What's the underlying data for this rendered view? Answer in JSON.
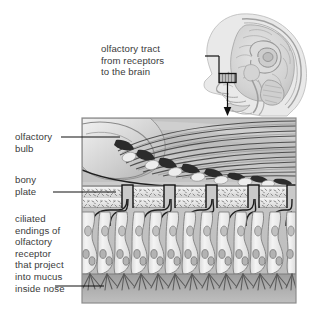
{
  "figure": {
    "background_color": "#ffffff",
    "text_color": "#3b3b3b",
    "line_color": "#1a1a1a"
  },
  "labels": {
    "olfactory_tract": "olfactory tract\nfrom receptors\nto the brain",
    "olfactory_bulb": "olfactory\nbulb",
    "bony_plate": "bony\nplate",
    "ciliated_endings": "ciliated\nendings of\nolfactory\nreceptor\nthat project\ninto mucus\ninside nose"
  },
  "head_diagram": {
    "name": "sagittal-head-section",
    "highlight_box_label": "olfactory epithelium region",
    "fill_color": "#d8d8d8",
    "outline_color": "#8a8a8a"
  },
  "detail_panel": {
    "name": "olfactory-epithelium-detail",
    "border_color": "#8c8c8c",
    "bands": [
      {
        "name": "olfactory-bulb-layer",
        "color": "#b4b4b4"
      },
      {
        "name": "bony-plate-layer",
        "color": "#ededed"
      },
      {
        "name": "epithelium-cell-layer",
        "color": "#cfcfcf"
      },
      {
        "name": "mucus-layer",
        "color": "#a8a8a8"
      }
    ],
    "cell_count": 14,
    "bone_channel_count": 5
  }
}
